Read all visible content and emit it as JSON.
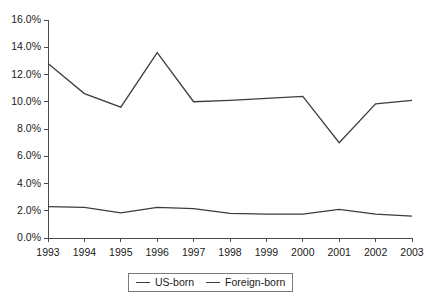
{
  "chart_data": {
    "type": "line",
    "title": "",
    "subtitle": "",
    "xlabel": "",
    "ylabel": "",
    "categories": [
      "1993",
      "1994",
      "1995",
      "1996",
      "1997",
      "1998",
      "1999",
      "2000",
      "2001",
      "2002",
      "2003"
    ],
    "x": [
      1993,
      1994,
      1995,
      1996,
      1997,
      1998,
      1999,
      2000,
      2001,
      2002,
      2003
    ],
    "series": [
      {
        "name": "US-born",
        "color": "#3d3d3d",
        "values": [
          2.3,
          2.25,
          1.85,
          2.25,
          2.15,
          1.8,
          1.75,
          1.75,
          2.1,
          1.75,
          1.6
        ]
      },
      {
        "name": "Foreign-born",
        "color": "#3d3d3d",
        "values": [
          12.8,
          10.6,
          9.6,
          13.6,
          10.0,
          10.1,
          10.25,
          10.4,
          7.0,
          9.85,
          10.1
        ]
      }
    ],
    "ylim": [
      0.0,
      16.0
    ],
    "ytick_values": [
      0.0,
      2.0,
      4.0,
      6.0,
      8.0,
      10.0,
      12.0,
      14.0,
      16.0
    ],
    "ytick_labels": [
      "0.0%",
      "2.0%",
      "4.0%",
      "6.0%",
      "8.0%",
      "10.0%",
      "12.0%",
      "14.0%",
      "16.0%"
    ],
    "grid": false,
    "legend_position": "bottom-center",
    "legend_entries": [
      "US-born",
      "Foreign-born"
    ],
    "axis_color": "#4a4a4a",
    "background": "#ffffff"
  }
}
